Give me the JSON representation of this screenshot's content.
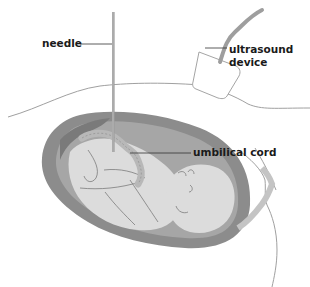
{
  "diagram": {
    "labels": {
      "needle": "needle",
      "ultrasound_line1": "ultrasound",
      "ultrasound_line2": "device",
      "umbilical_cord": "umbilical cord"
    },
    "colors": {
      "background": "#ffffff",
      "outline": "#9a9a9a",
      "uterus_wall": "#8c8c8c",
      "amniotic_fluid": "#a8a8a8",
      "fetus": "#dcdcdc",
      "fetus_line": "#6e6e6e",
      "cord": "#b8b8b8",
      "needle": "#9c9c9c",
      "leader_line": "#333333",
      "probe_cable": "#9e9e9e"
    }
  }
}
